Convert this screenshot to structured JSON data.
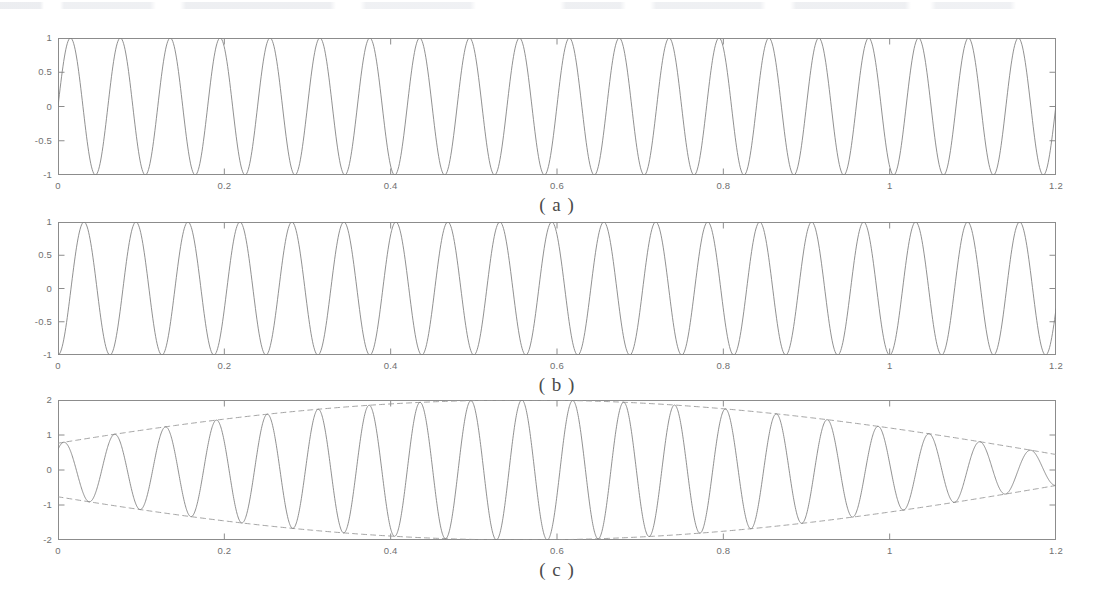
{
  "figure": {
    "background": "#ffffff",
    "axis_color": "#8c8c8c",
    "curve_color": "#7d7d7d",
    "envelope_color": "#9a9a9a",
    "text_color": "#707070",
    "top_artifact_note": ""
  },
  "panels": [
    {
      "id": "a",
      "caption": "( a )",
      "box": {
        "x": 58,
        "y": 38,
        "w": 998,
        "h": 137
      },
      "ylabels": [
        "1",
        "0.5",
        "0",
        "-0.5",
        "-1"
      ],
      "yvalues": [
        1,
        0.5,
        0,
        -0.5,
        -1
      ],
      "xlabels": [
        "0",
        "0.2",
        "0.4",
        "0.6",
        "0.8",
        "1",
        "1.2"
      ],
      "xvalues": [
        0,
        0.2,
        0.4,
        0.6,
        0.8,
        1,
        1.2
      ]
    },
    {
      "id": "b",
      "caption": "( b )",
      "box": {
        "x": 58,
        "y": 222,
        "w": 998,
        "h": 133
      },
      "ylabels": [
        "1",
        "0.5",
        "0",
        "-0.5",
        "-1"
      ],
      "yvalues": [
        1,
        0.5,
        0,
        -0.5,
        -1
      ],
      "xlabels": [
        "0",
        "0.2",
        "0.4",
        "0.6",
        "0.8",
        "1",
        "1.2"
      ],
      "xvalues": [
        0,
        0.2,
        0.4,
        0.6,
        0.8,
        1,
        1.2
      ]
    },
    {
      "id": "c",
      "caption": "( c )",
      "box": {
        "x": 58,
        "y": 400,
        "w": 998,
        "h": 140
      },
      "ylabels": [
        "2",
        "1",
        "0",
        "-1",
        "-2"
      ],
      "yvalues": [
        2,
        1,
        0,
        -1,
        -2
      ],
      "xlabels": [
        "0",
        "0.2",
        "0.4",
        "0.6",
        "0.8",
        "1",
        "1.2"
      ],
      "xvalues": [
        0,
        0.2,
        0.4,
        0.6,
        0.8,
        1,
        1.2
      ]
    }
  ],
  "chart_data": [
    {
      "type": "line",
      "panel": "a",
      "title": "( a )",
      "xlabel": "",
      "ylabel": "",
      "xlim": [
        0,
        1.2
      ],
      "ylim": [
        -1,
        1
      ],
      "xticks": [
        0,
        0.2,
        0.4,
        0.6,
        0.8,
        1,
        1.2
      ],
      "yticks": [
        -1,
        -0.5,
        0,
        0.5,
        1
      ],
      "grid": false,
      "legend": "none",
      "series": [
        {
          "name": "sin(2*pi*f1*t)",
          "style": "solid",
          "amplitude": 1.0,
          "frequency_hz": 16.67,
          "phase_deg": 0,
          "samples": 1400
        }
      ],
      "annotations": [
        "starts at 0 rising; ~20 full cycles over 0 to 1.2 s"
      ]
    },
    {
      "type": "line",
      "panel": "b",
      "title": "( b )",
      "xlabel": "",
      "ylabel": "",
      "xlim": [
        0,
        1.2
      ],
      "ylim": [
        -1,
        1
      ],
      "xticks": [
        0,
        0.2,
        0.4,
        0.6,
        0.8,
        1,
        1.2
      ],
      "yticks": [
        -1,
        -0.5,
        0,
        0.5,
        1
      ],
      "grid": false,
      "legend": "none",
      "series": [
        {
          "name": "-cos(2*pi*f2*t)",
          "style": "solid",
          "amplitude": 1.0,
          "frequency_hz": 16.0,
          "phase_deg": 180,
          "samples": 1400
        }
      ],
      "annotations": [
        "starts at -1 (trough) at t = 0; ~19.2 cycles over 0 to 1.2 s"
      ]
    },
    {
      "type": "line",
      "panel": "c",
      "title": "( c )",
      "xlabel": "",
      "ylabel": "",
      "xlim": [
        0,
        1.2
      ],
      "ylim": [
        -2,
        2
      ],
      "xticks": [
        0,
        0.2,
        0.4,
        0.6,
        0.8,
        1,
        1.2
      ],
      "yticks": [
        -2,
        -1,
        0,
        1,
        2
      ],
      "grid": false,
      "legend": "none",
      "series": [
        {
          "name": "sum signal (beat)",
          "style": "solid",
          "amplitude_peak": 2.0,
          "carrier_frequency_hz": 16.33,
          "beat_frequency_hz": 0.78,
          "samples": 2600
        },
        {
          "name": "upper envelope",
          "style": "dashed",
          "amplitude_peak": 2.0,
          "samples": 600
        },
        {
          "name": "lower envelope",
          "style": "dashed",
          "amplitude_peak": -2.0,
          "samples": 600
        }
      ],
      "annotations": [
        "envelope maxima near t = 0.12 and t = 0.76",
        "envelope nodes (pinch points) near t = 0.44 and t = 1.07",
        "value at t = 0 is about -1.6"
      ]
    }
  ]
}
